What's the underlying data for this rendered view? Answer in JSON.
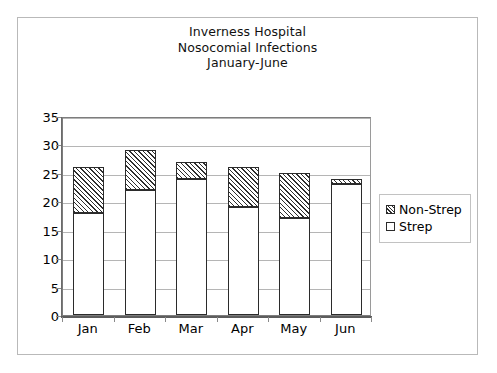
{
  "chart_data": {
    "type": "bar",
    "title": "Inverness Hospital Nosocomial Infections January-June",
    "title_lines": [
      "Inverness Hospital",
      "Nosocomial Infections",
      "January-June"
    ],
    "xlabel": "",
    "ylabel": "",
    "categories": [
      "Jan",
      "Feb",
      "Mar",
      "Apr",
      "May",
      "Jun"
    ],
    "series": [
      {
        "name": "Strep",
        "values": [
          18,
          22,
          24,
          19,
          17,
          23
        ],
        "fill": "solid-white"
      },
      {
        "name": "Non-Strep",
        "values": [
          8,
          7,
          3,
          7,
          8,
          1
        ],
        "fill": "diagonal-hatch"
      }
    ],
    "totals": [
      26,
      29,
      27,
      26,
      25,
      24
    ],
    "stacked": true,
    "ylim": [
      0,
      35
    ],
    "yticks": [
      0,
      5,
      10,
      15,
      20,
      25,
      30,
      35
    ],
    "ytick_labels": [
      "0",
      "5",
      "10",
      "15",
      "20",
      "25",
      "30",
      "35"
    ],
    "grid": "horizontal",
    "legend_position": "right",
    "legend_entries": [
      "Non-Strep",
      "Strep"
    ],
    "colors": {
      "bar_outline": "#2b2b2b",
      "hatch": "#2e2e2e",
      "strep_fill": "#ffffff",
      "gridline": "#b5b5b5",
      "axis": "#6b6b6b",
      "frame": "#b9b9b9",
      "text": "#000000",
      "background": "#ffffff"
    }
  }
}
